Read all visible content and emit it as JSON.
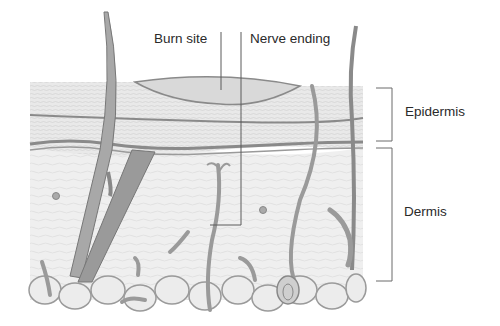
{
  "diagram": {
    "type": "anatomical cross-section of skin",
    "labels": {
      "burn_site": "Burn site",
      "nerve_ending": "Nerve ending",
      "epidermis": "Epidermis",
      "dermis": "Dermis"
    },
    "colors": {
      "line": "#5a5a5a",
      "tissue_fill": "#e6e6e6",
      "layer_stroke": "#8a8a8a",
      "text": "#2a2a2a"
    }
  }
}
